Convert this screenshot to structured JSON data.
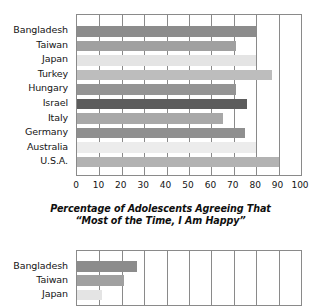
{
  "chart_data": [
    {
      "type": "bar",
      "orientation": "horizontal",
      "title": "Percentage of Adolescents Agreeing That “Most of the Time, I Am Happy”",
      "title_line1": "Percentage of Adolescents Agreeing That",
      "title_line2": "“Most of the Time, I Am Happy”",
      "xlabel": "",
      "ylabel": "",
      "xlim": [
        0,
        100
      ],
      "xticks": [
        "0",
        "10",
        "20",
        "30",
        "40",
        "50",
        "60",
        "70",
        "80",
        "90",
        "100"
      ],
      "grid": true,
      "legend": "none",
      "categories": [
        "Bangladesh",
        "Taiwan",
        "Japan",
        "Turkey",
        "Hungary",
        "Israel",
        "Italy",
        "Germany",
        "Australia",
        "U.S.A."
      ],
      "values": [
        80,
        71,
        80,
        87,
        71,
        76,
        65,
        75,
        80,
        90
      ],
      "bar_colors": [
        "#8c8c8c",
        "#a0a0a0",
        "#e4e4e4",
        "#bdbdbd",
        "#949494",
        "#5c5c5c",
        "#a8a8a8",
        "#8f8f8f",
        "#ececec",
        "#b2b2b2"
      ]
    },
    {
      "type": "bar",
      "orientation": "horizontal",
      "title": "",
      "xlim": [
        0,
        100
      ],
      "xticks": [],
      "grid": true,
      "legend": "none",
      "categories": [
        "Bangladesh",
        "Taiwan",
        "Japan"
      ],
      "values": [
        27,
        21,
        11
      ],
      "bar_colors": [
        "#8c8c8c",
        "#a0a0a0",
        "#e4e4e4"
      ]
    }
  ],
  "chart_top": {
    "caption_line1": "Percentage of Adolescents Agreeing That",
    "caption_line2": "“Most of the Time, I Am Happy”"
  }
}
